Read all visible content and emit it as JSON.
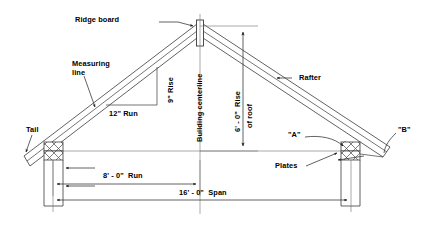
{
  "diagram": {
    "type": "architectural-section-drawing",
    "colors": {
      "line": "#3a3a3a",
      "text": "#000000",
      "background": "#ffffff",
      "hatch": "#4a4a4a"
    },
    "labels": {
      "ridge_board": "Ridge board",
      "measuring_line_1": "Measuring",
      "measuring_line_2": "line",
      "rise_small": "9\" Rise",
      "run_small": "12\" Run",
      "building_centerline": "Building centerline",
      "rafter": "Rafter",
      "rise_of_roof_1": "6' - 0\"  Rise",
      "rise_of_roof_2": "of roof",
      "tail": "Tail",
      "point_a": "\"A\"",
      "point_b": "\"B\"",
      "plates": "Plates",
      "run_dim": "8' - 0\"  Run",
      "span_dim": "16' - 0\"  Span"
    },
    "dimensions": {
      "rise_of_roof": "6' - 0\"",
      "run": "8' - 0\"",
      "span": "16' - 0\"",
      "unit_rise": "9\"",
      "unit_run": "12\"",
      "pitch_ratio": "9 in 12"
    },
    "annotations": [
      {
        "name": "ridge-board",
        "text": "Ridge board",
        "target": "roof apex ridge member"
      },
      {
        "name": "measuring-line",
        "text": "Measuring line",
        "target": "rafter measuring line"
      },
      {
        "name": "rafter",
        "text": "Rafter",
        "target": "right rafter member"
      },
      {
        "name": "tail",
        "text": "Tail",
        "target": "left rafter tail overhang"
      },
      {
        "name": "point-a",
        "text": "\"A\"",
        "target": "birdsmouth seat cut at plate"
      },
      {
        "name": "point-b",
        "text": "\"B\"",
        "target": "rafter tail end cut"
      },
      {
        "name": "plates",
        "text": "Plates",
        "target": "top wall plates"
      }
    ]
  }
}
